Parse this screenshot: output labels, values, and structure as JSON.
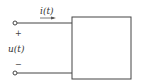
{
  "diagram": {
    "type": "circuit-one-port",
    "current_label": "i(t)",
    "voltage_label": "u(t)",
    "plus_sign": "+",
    "minus_sign": "−",
    "colors": {
      "line": "#444444",
      "background": "#ffffff"
    }
  }
}
